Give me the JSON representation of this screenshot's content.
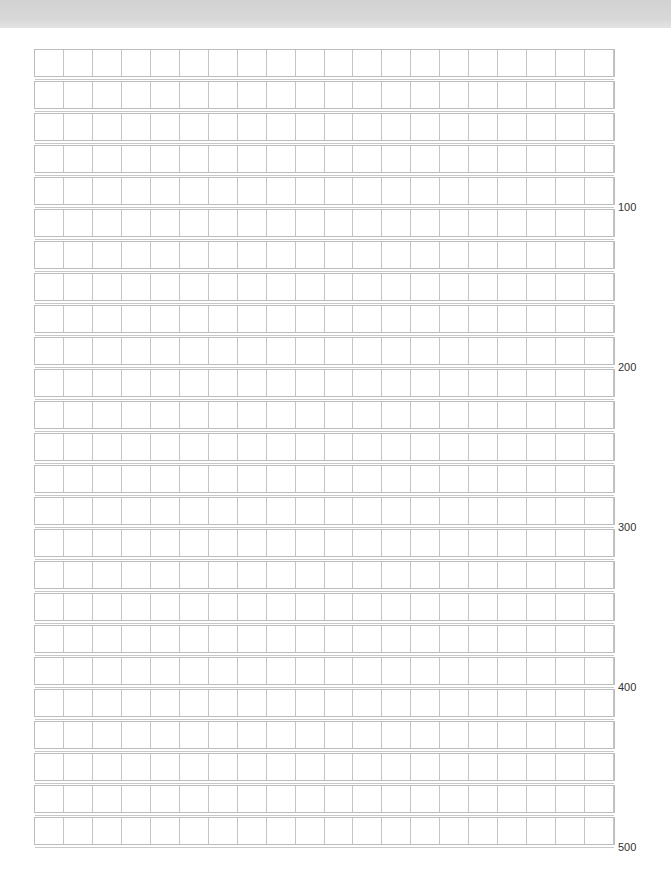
{
  "sheet": {
    "type": "manuscript-grid-paper",
    "columns": 20,
    "rows": 25,
    "line_color": "#bcbcbc",
    "header_band_color": "#d6d6d6"
  },
  "counters": [
    {
      "label": "100",
      "after_row": 5
    },
    {
      "label": "200",
      "after_row": 10
    },
    {
      "label": "300",
      "after_row": 15
    },
    {
      "label": "400",
      "after_row": 20
    },
    {
      "label": "500",
      "after_row": 25
    }
  ]
}
